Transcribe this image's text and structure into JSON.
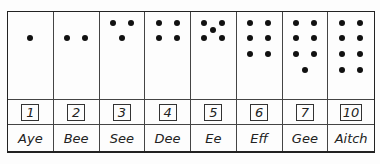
{
  "columns": [
    {
      "number": "1",
      "name": "Aye",
      "dots": [
        [
          0.5,
          0.55
        ]
      ]
    },
    {
      "number": "2",
      "name": "Bee",
      "dots": [
        [
          0.3,
          0.55
        ],
        [
          0.7,
          0.55
        ]
      ]
    },
    {
      "number": "3",
      "name": "See",
      "dots": [
        [
          0.3,
          0.22
        ],
        [
          0.7,
          0.22
        ],
        [
          0.5,
          0.55
        ]
      ]
    },
    {
      "number": "4",
      "name": "Dee",
      "dots": [
        [
          0.3,
          0.22
        ],
        [
          0.7,
          0.22
        ],
        [
          0.3,
          0.55
        ],
        [
          0.7,
          0.55
        ]
      ]
    },
    {
      "number": "5",
      "name": "Ee",
      "dots": [
        [
          0.3,
          0.22
        ],
        [
          0.7,
          0.22
        ],
        [
          0.5,
          0.38
        ],
        [
          0.3,
          0.55
        ],
        [
          0.7,
          0.55
        ]
      ]
    },
    {
      "number": "6",
      "name": "Eff",
      "dots": [
        [
          0.3,
          0.22
        ],
        [
          0.7,
          0.22
        ],
        [
          0.3,
          0.55
        ],
        [
          0.7,
          0.55
        ],
        [
          0.3,
          0.87
        ],
        [
          0.7,
          0.87
        ]
      ]
    },
    {
      "number": "7",
      "name": "Gee",
      "dots": [
        [
          0.3,
          0.22
        ],
        [
          0.7,
          0.22
        ],
        [
          0.3,
          0.55
        ],
        [
          0.7,
          0.55
        ],
        [
          0.3,
          0.87
        ],
        [
          0.7,
          0.87
        ],
        [
          0.5,
          1.2
        ]
      ]
    },
    {
      "number": "10",
      "name": "Aitch",
      "dots": [
        [
          0.3,
          0.22
        ],
        [
          0.7,
          0.22
        ],
        [
          0.3,
          0.55
        ],
        [
          0.7,
          0.55
        ],
        [
          0.3,
          0.87
        ],
        [
          0.7,
          0.87
        ],
        [
          0.3,
          1.2
        ],
        [
          0.7,
          1.2
        ]
      ]
    }
  ]
}
